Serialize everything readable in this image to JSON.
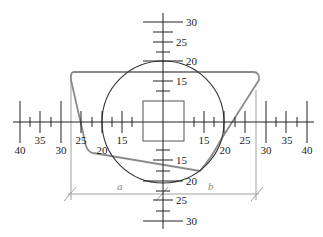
{
  "diagram": {
    "type": "coordinate-gauge-diagram",
    "horizontal_axis": {
      "left_labels": [
        "40",
        "35",
        "30",
        "25",
        "20",
        "15"
      ],
      "right_labels": [
        "15",
        "20",
        "25",
        "30",
        "35",
        "40"
      ]
    },
    "vertical_axis": {
      "top_labels": [
        "30",
        "25",
        "20",
        "15"
      ],
      "bottom_labels": [
        "15",
        "20",
        "25",
        "30"
      ]
    },
    "dimensions": {
      "a_label": "a",
      "b_label": "b"
    },
    "colors": {
      "axis": "#222222",
      "circle": "#333333",
      "polygon": "#8a8a8a",
      "dimension": "#9a9a9a",
      "square": "#555555"
    }
  }
}
